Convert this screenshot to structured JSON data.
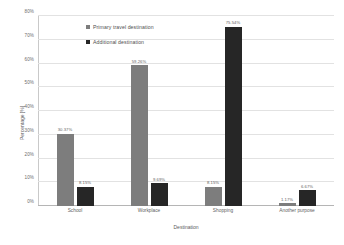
{
  "chart_data": {
    "type": "bar",
    "title": "",
    "xlabel": "Destination",
    "ylabel": "Percentage [%]",
    "categories": [
      "School",
      "Workplace",
      "Shopping",
      "Another purpose"
    ],
    "ylim": [
      0,
      80
    ],
    "yticks": [
      "0%",
      "10%",
      "20%",
      "30%",
      "40%",
      "50%",
      "60%",
      "70%",
      "80%"
    ],
    "ytick_values": [
      0,
      10,
      20,
      30,
      40,
      50,
      60,
      70,
      80
    ],
    "grid": true,
    "legend_position": "inside-top-left",
    "series": [
      {
        "name": "Primary travel destination",
        "color": "#7d7d7d",
        "values": [
          30.37,
          59.26,
          8.15,
          1.17
        ],
        "labels": [
          "30.37%",
          "59.26%",
          "8.15%",
          "1.17%"
        ]
      },
      {
        "name": "Additional destination",
        "color": "#262626",
        "values": [
          8.15,
          9.69,
          75.54,
          6.67
        ],
        "labels": [
          "8.15%",
          "9.69%",
          "75.54%",
          "6.67%"
        ]
      }
    ]
  }
}
